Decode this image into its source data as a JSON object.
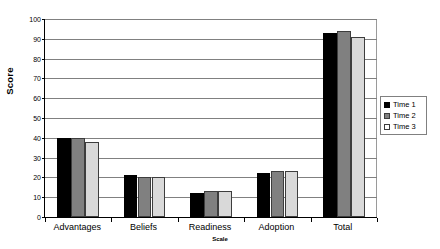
{
  "chart_data": {
    "type": "bar",
    "title": "",
    "xlabel": "Scale",
    "ylabel": "Score",
    "ylim": [
      0,
      100
    ],
    "ytick_step": 10,
    "yticks": [
      0,
      10,
      20,
      30,
      40,
      50,
      60,
      70,
      80,
      90,
      100
    ],
    "grid": true,
    "legend_position": "right",
    "categories": [
      "Advantages",
      "Beliefs",
      "Readiness",
      "Adoption",
      "Total"
    ],
    "series": [
      {
        "name": "Time 1",
        "color": "#000000",
        "values": [
          40,
          21,
          12,
          22,
          93
        ]
      },
      {
        "name": "Time 2",
        "color": "#808080",
        "values": [
          40,
          20,
          13,
          23,
          94
        ]
      },
      {
        "name": "Time 3",
        "color": "#d9d9d9",
        "values": [
          38,
          20,
          13,
          23,
          91
        ]
      }
    ]
  }
}
